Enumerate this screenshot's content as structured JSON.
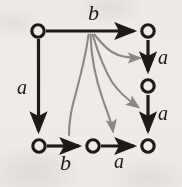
{
  "figure": {
    "kind": "state-transition-diagram",
    "background_color": "#f3f1ee",
    "ink_color": "#1d1b1a",
    "gray_arrow_color": "#8b8b8b",
    "width": 182,
    "height": 187
  },
  "nodes": [
    {
      "id": "n-top-left",
      "label": "",
      "cx": 38,
      "cy": 31,
      "r": 6.2
    },
    {
      "id": "n-top-right",
      "label": "",
      "cx": 148,
      "cy": 31,
      "r": 6.2
    },
    {
      "id": "n-mid-right",
      "label": "",
      "cx": 148,
      "cy": 86,
      "r": 6.2
    },
    {
      "id": "n-bottom-left",
      "label": "",
      "cx": 39,
      "cy": 146,
      "r": 6.2
    },
    {
      "id": "n-bottom-middle",
      "label": "",
      "cx": 93,
      "cy": 146,
      "r": 6.2
    },
    {
      "id": "n-bottom-right",
      "label": "",
      "cx": 148,
      "cy": 146,
      "r": 6.2
    }
  ],
  "edges": [
    {
      "id": "edge-top-b",
      "label": "b",
      "style": "straight-black",
      "from": "n-top-left",
      "to": "n-top-right"
    },
    {
      "id": "edge-left-a",
      "label": "a",
      "style": "straight-black",
      "from": "n-top-left",
      "to": "n-bottom-left"
    },
    {
      "id": "edge-right-a-upper",
      "label": "a",
      "style": "straight-black",
      "from": "n-top-right",
      "to": "n-mid-right"
    },
    {
      "id": "edge-right-a-lower",
      "label": "a",
      "style": "straight-black",
      "from": "n-mid-right",
      "to": "n-bottom-right"
    },
    {
      "id": "edge-bottom-b",
      "label": "b",
      "style": "straight-black",
      "from": "n-bottom-left",
      "to": "n-bottom-middle"
    },
    {
      "id": "edge-bottom-a",
      "label": "a",
      "style": "straight-black",
      "from": "n-bottom-middle",
      "to": "n-bottom-right"
    },
    {
      "id": "edge-gray-1",
      "label": "",
      "style": "curved-gray",
      "from": "bundle",
      "to": "n-mid-right"
    },
    {
      "id": "edge-gray-2",
      "label": "",
      "style": "curved-gray",
      "from": "bundle",
      "to": "n-bottom-right"
    },
    {
      "id": "edge-gray-3",
      "label": "",
      "style": "curved-gray",
      "from": "bundle",
      "to": "n-bottom-right"
    },
    {
      "id": "edge-gray-4",
      "label": "",
      "style": "curved-gray",
      "from": "bundle",
      "to": "n-bottom-middle"
    }
  ],
  "labels": [
    {
      "id": "label-b-top",
      "text": "b",
      "x": 88,
      "y": 2,
      "size": 22
    },
    {
      "id": "label-a-left",
      "text": "a",
      "x": 17,
      "y": 77,
      "size": 20
    },
    {
      "id": "label-a-right-1",
      "text": "a",
      "x": 158,
      "y": 47,
      "size": 20
    },
    {
      "id": "label-a-right-2",
      "text": "a",
      "x": 158,
      "y": 103,
      "size": 20
    },
    {
      "id": "label-b-bottom",
      "text": "b",
      "x": 60,
      "y": 152,
      "size": 22
    },
    {
      "id": "label-a-bottom",
      "text": "a",
      "x": 114,
      "y": 151,
      "size": 20
    }
  ]
}
